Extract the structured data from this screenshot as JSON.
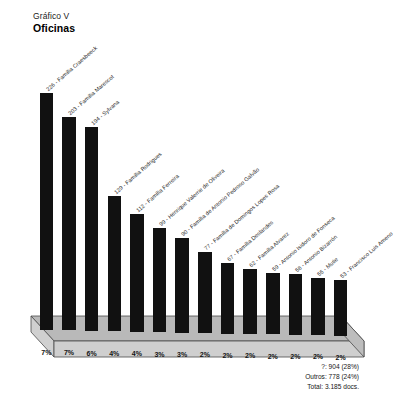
{
  "title": {
    "label": "Gráfico V",
    "subtitle": "Oficinas"
  },
  "summary": {
    "unknown": "?: 904 (28%)",
    "others": "Outros: 778 (24%)",
    "total": "Total: 3.185 docs."
  },
  "chart_data": {
    "type": "bar",
    "xlabel": "",
    "ylabel": "",
    "grid": false,
    "legend": "none",
    "ylim": [
      0,
      240
    ],
    "categories": [
      "226 - Família Craesbeeck",
      "203 - Família Marescot",
      "194 - Sylvana",
      "129 - Família Rodrigues",
      "112 - Família Ferreira",
      "99 - Henrique Valerrie de Oliveira",
      "90 - Família de Antonio Pedroso Galvão",
      "77 - Família de Domingos Lopes Rosa",
      "67 - Família Deslandes",
      "62 - Família Alvarez",
      "59 - Antonio Isidoro de Fonseca",
      "58 - Antonio Bizarrón",
      "55 - Mutie",
      "53 - Francisco Luis Ameno"
    ],
    "values": [
      226,
      203,
      194,
      129,
      112,
      99,
      90,
      77,
      67,
      62,
      59,
      58,
      55,
      53
    ],
    "percent_labels": [
      "7%",
      "7%",
      "6%",
      "4%",
      "4%",
      "3%",
      "3%",
      "2%",
      "2%",
      "2%",
      "2%",
      "2%",
      "2%",
      "2%"
    ],
    "bar_color": "#111111",
    "base_color": "#b9b9b9"
  }
}
